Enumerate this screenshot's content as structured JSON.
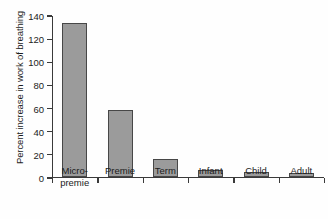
{
  "chart_data": {
    "type": "bar",
    "title": "",
    "xlabel": "",
    "ylabel": "Percent increase in work of breathing",
    "categories": [
      "Micro-\npremie",
      "Premie",
      "Term",
      "Infant",
      "Child",
      "Adult"
    ],
    "values": [
      133,
      57.5,
      15.5,
      6,
      4,
      3
    ],
    "ylim": [
      0,
      140
    ],
    "yticks": [
      0,
      20,
      40,
      60,
      80,
      100,
      120,
      140
    ],
    "ytick_labels": [
      "0",
      "20",
      "40",
      "60",
      "80",
      "100",
      "120",
      "140"
    ],
    "grid": false,
    "legend": "none",
    "bar_fill_color": "#9b9b9b",
    "bar_edge_color": "#474747",
    "axis_color": "#3a3a3a",
    "background_color": "#fefefe"
  }
}
